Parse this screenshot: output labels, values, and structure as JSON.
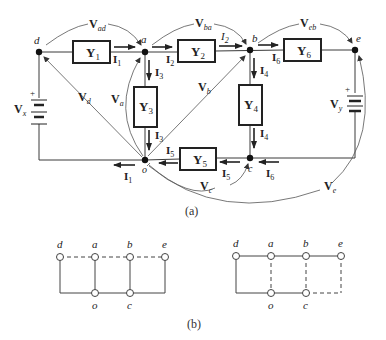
{
  "figure": {
    "part_a": {
      "caption": "(a)",
      "nodes": [
        {
          "id": "d",
          "label": "d"
        },
        {
          "id": "a",
          "label": "a"
        },
        {
          "id": "b",
          "label": "b"
        },
        {
          "id": "e",
          "label": "e"
        },
        {
          "id": "o",
          "label": "o"
        },
        {
          "id": "c",
          "label": "c"
        }
      ],
      "admittances": [
        {
          "label": "Y",
          "sub": "1",
          "between": "d-a"
        },
        {
          "label": "Y",
          "sub": "2",
          "between": "a-b"
        },
        {
          "label": "Y",
          "sub": "6",
          "between": "b-e"
        },
        {
          "label": "Y",
          "sub": "3",
          "between": "a-o"
        },
        {
          "label": "Y",
          "sub": "4",
          "between": "b-c"
        },
        {
          "label": "Y",
          "sub": "5",
          "between": "o-c"
        }
      ],
      "sources": [
        {
          "label": "V",
          "sub": "x",
          "plus": "+"
        },
        {
          "label": "V",
          "sub": "y",
          "plus": "+"
        }
      ],
      "currents": [
        {
          "label": "I",
          "sub": "1"
        },
        {
          "label": "I",
          "sub": "2"
        },
        {
          "label": "I",
          "sub": "3"
        },
        {
          "label": "I",
          "sub": "4"
        },
        {
          "label": "I",
          "sub": "5"
        },
        {
          "label": "I",
          "sub": "6"
        }
      ],
      "branch_voltages": [
        {
          "label": "V",
          "sub": "ad"
        },
        {
          "label": "V",
          "sub": "ba"
        },
        {
          "label": "V",
          "sub": "eb"
        }
      ],
      "node_voltages": [
        {
          "label": "V",
          "sub": "d"
        },
        {
          "label": "V",
          "sub": "a"
        },
        {
          "label": "V",
          "sub": "b"
        },
        {
          "label": "V",
          "sub": "c"
        },
        {
          "label": "V",
          "sub": "e"
        }
      ]
    },
    "part_b": {
      "caption": "(b)",
      "graphs": [
        {
          "labels": {
            "d": "d",
            "a": "a",
            "b": "b",
            "e": "e",
            "o": "o",
            "c": "c"
          }
        },
        {
          "labels": {
            "d": "d",
            "a": "a",
            "b": "b",
            "e": "e",
            "o": "o",
            "c": "c"
          }
        }
      ]
    }
  }
}
